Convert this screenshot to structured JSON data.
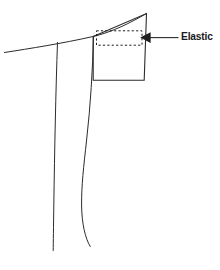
{
  "diagram": {
    "type": "technical-illustration",
    "background_color": "#ffffff",
    "line_color": "#2b2b2b",
    "callouts": [
      {
        "id": "elastic",
        "label": "Elastic",
        "points_to": "dashed rectangle inside waistband",
        "arrow_direction": "left"
      }
    ],
    "elements": {
      "waistband_panel": "quadrilateral with upward-sloping top edge",
      "elastic_casing": "dashed rectangle",
      "garment_top_edge": "long sloping line across upper left",
      "garment_side_seams": "two long near-vertical drape lines"
    }
  }
}
